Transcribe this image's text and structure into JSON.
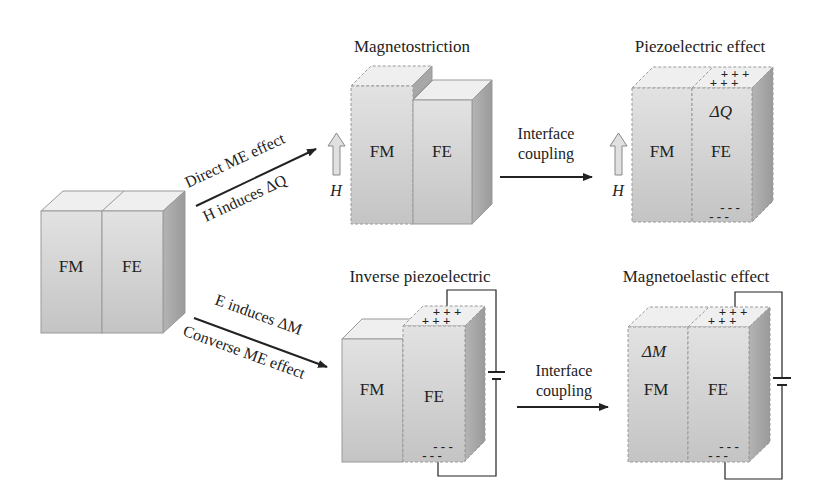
{
  "diagram": {
    "initial_box": {
      "left_label": "FM",
      "right_label": "FE"
    },
    "direct_path": {
      "arrow_label_top": "Direct ME effect",
      "arrow_label_bottom": "H induces ΔQ",
      "field_label": "H",
      "stage1": {
        "title": "Magnetostriction",
        "left_label": "FM",
        "right_label": "FE"
      },
      "coupling_label_line1": "Interface",
      "coupling_label_line2": "coupling",
      "field_label_2": "H",
      "stage2": {
        "title": "Piezoelectric effect",
        "left_label": "FM",
        "right_label": "FE",
        "charge_label": "ΔQ",
        "top_charges": "+ + +",
        "bottom_charges": "- - -"
      }
    },
    "converse_path": {
      "arrow_label_top": "E induces ΔM",
      "arrow_label_bottom": "Converse ME effect",
      "stage1": {
        "title": "Inverse piezoelectric",
        "left_label": "FM",
        "right_label": "FE",
        "top_charges": "+ + +",
        "bottom_charges": "- - -"
      },
      "coupling_label_line1": "Interface",
      "coupling_label_line2": "coupling",
      "stage2": {
        "title": "Magnetoelastic effect",
        "left_label": "FM",
        "right_label": "FE",
        "magnetization_label": "ΔM",
        "top_charges": "+ + +",
        "bottom_charges": "- - -"
      }
    }
  },
  "colors": {
    "front": "#d4d4d4",
    "top": "#ececec",
    "side": "#a9a9a9",
    "edge": "#8a8a8a",
    "line": "#222222"
  }
}
